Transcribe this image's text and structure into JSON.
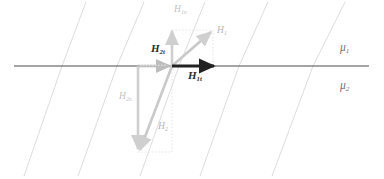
{
  "figure": {
    "width": 384,
    "height": 179,
    "background": "#ffffff"
  },
  "colors": {
    "interface_line": "#4a4a4a",
    "field_line": "#d4d4d4",
    "vector_dark": "#222222",
    "vector_gray": "#bdbdbd",
    "vector_gray_light": "#cfcfcf",
    "guide_dotted": "#dcdcdc",
    "label_dark": "#2b2b2b",
    "label_gray": "#c2c2c2",
    "label_mu": "#6f6f6f"
  },
  "labels": {
    "h1": {
      "base": "H",
      "sub": "1"
    },
    "h1n": {
      "base": "H",
      "sub": "1n"
    },
    "h1t": {
      "base": "H",
      "sub": "1t"
    },
    "h2": {
      "base": "H",
      "sub": "2"
    },
    "h2n": {
      "base": "H",
      "sub": "2n"
    },
    "h2t": {
      "base": "H",
      "sub": "2t"
    },
    "mu1": {
      "base": "μ",
      "sub": "1"
    },
    "mu2": {
      "base": "μ",
      "sub": "2"
    }
  },
  "geometry": {
    "interface_y": 66,
    "interface_x_start": 14,
    "interface_x_end": 369,
    "origin": {
      "x": 172,
      "y": 66
    },
    "h1_tip": {
      "x": 213,
      "y": 30
    },
    "h1n_tip": {
      "x": 172,
      "y": 28
    },
    "h1t_tip": {
      "x": 216,
      "y": 66
    },
    "h2_tail": {
      "x": 138,
      "y": 152
    },
    "h2n_tip": {
      "x": 138,
      "y": 152
    },
    "h2t_tail": {
      "x": 138,
      "y": 66
    }
  },
  "field_lines": {
    "description": "Magnetic flux lines kinked at the interface; shallower slope in medium 1 (above), steeper in medium 2 (below)",
    "count": 5
  },
  "vectors": [
    {
      "name": "H1",
      "medium": 1,
      "style": "gray-diagonal",
      "description": "Total field vector in medium 1, pointing up and to the right"
    },
    {
      "name": "H1n",
      "medium": 1,
      "style": "gray-vertical",
      "description": "Normal component of H1, pointing straight up"
    },
    {
      "name": "H1t",
      "medium": 1,
      "style": "dark-horizontal",
      "description": "Tangential component of H1, bold black arrow pointing right"
    },
    {
      "name": "H2",
      "medium": 2,
      "style": "gray-diagonal",
      "description": "Total field vector in medium 2, pointing down and to the left"
    },
    {
      "name": "H2n",
      "medium": 2,
      "style": "gray-vertical",
      "description": "Normal component of H2, pointing straight down"
    },
    {
      "name": "H2t",
      "medium": 2,
      "style": "gray-horizontal",
      "description": "Tangential component of H2, gray arrow pointing right"
    }
  ],
  "media": [
    {
      "label": "mu1",
      "region": "above-interface",
      "permeability": "μ1"
    },
    {
      "label": "mu2",
      "region": "below-interface",
      "permeability": "μ2"
    }
  ]
}
